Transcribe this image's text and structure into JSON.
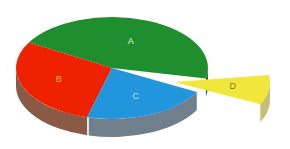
{
  "chart_data": {
    "type": "pie",
    "title": "",
    "subtitle": "",
    "xlabel": "",
    "ylabel": "",
    "legend": "none",
    "grid": false,
    "style": "3d-exploded-pie",
    "categories": [
      "A",
      "B",
      "C",
      "D"
    ],
    "values": [
      45,
      27,
      20,
      8
    ],
    "labels_inside": true,
    "exploded_slices": [
      "D"
    ],
    "depth_px": 18,
    "center": {
      "x": 112,
      "y": 68
    },
    "radius": {
      "rx": 96,
      "ry": 51
    },
    "start_angle_deg": -150,
    "slices": [
      {
        "name": "A",
        "label": "A",
        "value": 45,
        "top_color": "#1e8e2e",
        "side_color": "#166a22",
        "label_color": "#e8f5e9",
        "exploded": false,
        "start_deg": -150,
        "end_deg": 12
      },
      {
        "name": "B",
        "label": "B",
        "value": 27,
        "top_color": "#ee2200",
        "side_color": "#8b5a46",
        "label_color": "#ffb060",
        "exploded": false,
        "start_deg": 105,
        "end_deg": 210
      },
      {
        "name": "C",
        "label": "C",
        "value": 20,
        "top_color": "#2196dd",
        "side_color": "#6f7f8c",
        "label_color": "#bfe4fa",
        "exploded": false,
        "start_deg": 28,
        "end_deg": 105
      },
      {
        "name": "D",
        "label": "D",
        "value": 8,
        "top_color": "#f2e63d",
        "side_color": "#c4bf72",
        "label_color": "#7d7a2e",
        "exploded": true,
        "start_deg": -8,
        "end_deg": 26,
        "explode_dx": 62,
        "explode_dy": 14
      }
    ],
    "colors": {
      "A": "#1e8e2e",
      "B": "#ee2200",
      "C": "#2196dd",
      "D": "#f2e63d",
      "background": "#ffffff"
    }
  }
}
